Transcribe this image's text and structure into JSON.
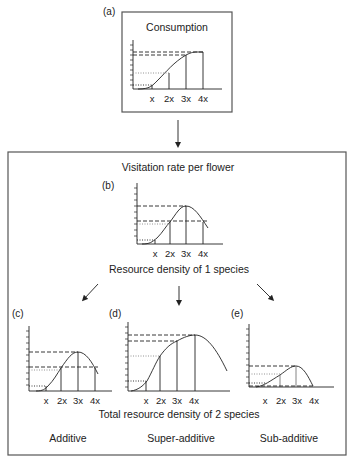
{
  "panel_a": {
    "label": "(a)",
    "title": "Consumption",
    "x_ticks": [
      "x",
      "2x",
      "3x",
      "4x"
    ]
  },
  "outer": {
    "title": "Visitation rate per flower",
    "caption_1species": "Resource density of 1 species",
    "caption_2species": "Total resource density of 2 species"
  },
  "panel_b": {
    "label": "(b)",
    "x_ticks": [
      "x",
      "2x",
      "3x",
      "4x"
    ]
  },
  "panel_c": {
    "label": "(c)",
    "x_ticks": [
      "x",
      "2x",
      "3x",
      "4x"
    ],
    "name": "Additive"
  },
  "panel_d": {
    "label": "(d)",
    "x_ticks": [
      "x",
      "2x",
      "3x",
      "4x"
    ],
    "name": "Super-additive"
  },
  "panel_e": {
    "label": "(e)",
    "x_ticks": [
      "x",
      "2x",
      "3x",
      "4x"
    ],
    "name": "Sub-additive"
  },
  "colors": {
    "line": "#222222",
    "box": "#666666",
    "dotted": "#888888"
  }
}
